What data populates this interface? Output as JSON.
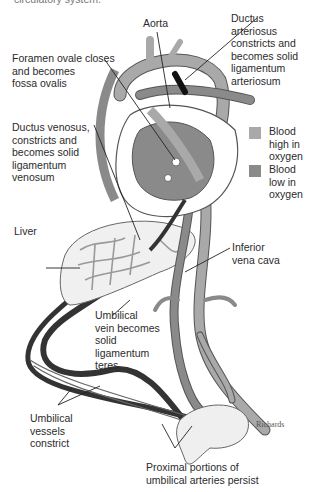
{
  "figure": {
    "caption_fragment": "circulatory system.",
    "signature": "Richards"
  },
  "labels": {
    "aorta": [
      "Aorta"
    ],
    "ductus_arteriosus": [
      "Ductus",
      "arteriosus",
      "constricts and",
      "becomes solid",
      "ligamentum",
      "arteriosum"
    ],
    "foramen_ovale": [
      "Foramen ovale closes",
      "and becomes",
      "fossa ovalis"
    ],
    "ductus_venosus": [
      "Ductus venosus,",
      "constricts and",
      "becomes solid",
      "ligamentum",
      "venosum"
    ],
    "liver": [
      "Liver"
    ],
    "inferior_vena_cava": [
      "Inferior",
      "vena cava"
    ],
    "umbilical_vein": [
      "Umbilical",
      "vein becomes",
      "solid",
      "ligamentum",
      "teres"
    ],
    "umbilical_vessels": [
      "Umbilical",
      "vessels",
      "constrict"
    ],
    "proximal_portions": [
      "Proximal portions of",
      "umbilical arteries persist"
    ]
  },
  "legend": {
    "items": [
      {
        "label": [
          "Blood",
          "high in",
          "oxygen"
        ],
        "color": "#a9a9a9"
      },
      {
        "label": [
          "Blood",
          "low in",
          "oxygen"
        ],
        "color": "#8a8a8a"
      }
    ]
  },
  "colors": {
    "vessel_light": "#a9a9a9",
    "vessel_dark": "#8a8a8a",
    "ligament": "#2a2a2a",
    "outline": "#555555"
  }
}
